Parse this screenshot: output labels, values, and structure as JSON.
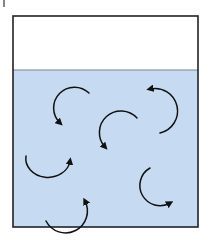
{
  "diagram": {
    "colors": {
      "background": "#ffffff",
      "liquid": "#c6dbf2",
      "water_line": "#6f86a6",
      "border": "#222222",
      "arrow": "#111111"
    },
    "container": {
      "x": 13,
      "y": 16,
      "width": 185,
      "height": 211
    },
    "water_line_y": 70,
    "tick_mark": {
      "x": 4,
      "y1": 0,
      "y2": 7
    },
    "arrows": [
      {
        "name": "arrow-upper-left",
        "path": "M 89 93 A 16 16 0 1 0 60 124",
        "head_at": [
          60,
          126
        ],
        "head_dir": "down"
      },
      {
        "name": "arrow-upper-right",
        "path": "M 160 133 A 18 18 0 0 0 150 89",
        "head_at": [
          146,
          88
        ],
        "head_dir": "left"
      },
      {
        "name": "arrow-center",
        "path": "M 137 118 A 16 16 0 0 0 105 148",
        "head_at": [
          104,
          151
        ],
        "head_dir": "down"
      },
      {
        "name": "arrow-mid-left",
        "path": "M 26 156 A 20 17 0 0 0 70 162",
        "head_at": [
          72,
          157
        ],
        "head_dir": "up"
      },
      {
        "name": "arrow-lower-right",
        "path": "M 150 168 A 20 20 0 0 0 170 204",
        "head_at": [
          174,
          205
        ],
        "head_dir": "right"
      },
      {
        "name": "arrow-bottom-left",
        "path": "M 46 221 A 20 20 0 0 0 85 202",
        "head_at": [
          86,
          197
        ],
        "head_dir": "up"
      }
    ]
  }
}
